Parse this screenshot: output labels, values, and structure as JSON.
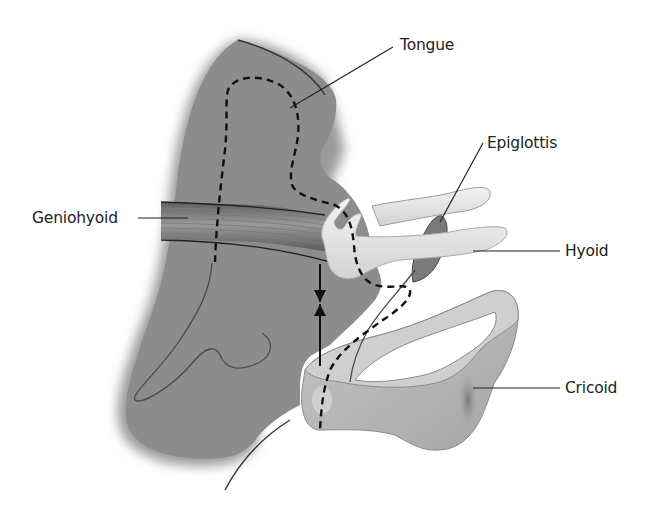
{
  "diagram": {
    "type": "anatomical-illustration",
    "labels": {
      "tongue": "Tongue",
      "epiglottis": "Epiglottis",
      "geniohyoid": "Geniohyoid",
      "hyoid": "Hyoid",
      "cricoid": "Cricoid"
    },
    "annotations": {
      "double_arrow": "vertical opposing arrows between hyoid and cricoid",
      "dashed_outline": "tongue / airway dashed outline"
    },
    "colors": {
      "soft_tissue": "#8c8c8c",
      "soft_tissue_edge": "#6e6e6e",
      "muscle_band": "#6a6a6a",
      "bone": "#e6e6e6",
      "cartilage": "#b4b4b4",
      "cartilage_light": "#cfcfcf",
      "epiglottis": "#7a7a7a",
      "line": "#1a1a1a",
      "text": "#222222",
      "background": "#ffffff"
    }
  }
}
